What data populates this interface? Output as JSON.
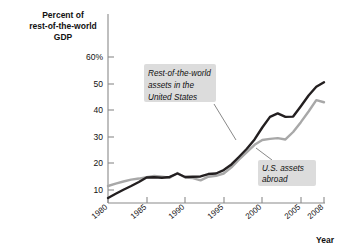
{
  "chart_data": {
    "type": "line",
    "title": "",
    "xlabel": "Year",
    "ylabel": "Percent of rest-of-the-world GDP",
    "ylabel_lines": [
      "Percent of",
      "rest-of-the-world",
      "GDP"
    ],
    "xlim": [
      1980,
      2008
    ],
    "ylim": [
      0,
      62
    ],
    "grid": false,
    "legend": "annotations-on-plot",
    "yticks": [
      10,
      20,
      30,
      40,
      50,
      60
    ],
    "ytick_labels": [
      "10",
      "20",
      "30",
      "40",
      "50",
      "60%"
    ],
    "xticks": [
      1980,
      1985,
      1990,
      1995,
      2000,
      2005,
      2008
    ],
    "xtick_labels": [
      "1980",
      "1985",
      "1990",
      "1995",
      "2000",
      "2005",
      "2008"
    ],
    "x": [
      1980,
      1981,
      1982,
      1983,
      1984,
      1985,
      1986,
      1987,
      1988,
      1989,
      1990,
      1991,
      1992,
      1993,
      1994,
      1995,
      1996,
      1997,
      1998,
      1999,
      2000,
      2001,
      2002,
      2003,
      2004,
      2005,
      2006,
      2007,
      2008
    ],
    "series": [
      {
        "name": "Rest-of-the-world assets in the United States",
        "color": "#231f20",
        "values": [
          7.0,
          8.6,
          10.1,
          11.5,
          13.0,
          14.7,
          14.8,
          14.6,
          14.9,
          16.2,
          14.9,
          15.0,
          15.1,
          16.0,
          16.2,
          17.5,
          19.6,
          22.5,
          25.5,
          29.0,
          33.5,
          37.5,
          38.8,
          37.5,
          37.6,
          41.5,
          45.5,
          48.8,
          50.5
        ]
      },
      {
        "name": "U.S. assets abroad",
        "color": "#a8a8a8",
        "values": [
          11.5,
          12.4,
          13.2,
          13.9,
          14.3,
          14.8,
          15.3,
          15.0,
          14.6,
          16.4,
          14.7,
          14.5,
          13.6,
          15.0,
          15.3,
          16.2,
          18.5,
          21.5,
          24.2,
          27.0,
          28.8,
          29.2,
          29.5,
          29.0,
          31.8,
          35.5,
          39.5,
          43.8,
          43.0
        ]
      }
    ],
    "annotations": [
      {
        "id": "annotation-row-assets",
        "lines": [
          "Rest-of-the-world",
          "assets in the",
          "United States"
        ],
        "target_series": "Rest-of-the-world assets in the United States"
      },
      {
        "id": "annotation-us-assets",
        "lines": [
          "U.S. assets",
          "abroad"
        ],
        "target_series": "U.S. assets abroad"
      }
    ]
  },
  "colors": {
    "dark_series": "#231f20",
    "gray_series": "#a8a8a8",
    "axis": "#8a8a8a",
    "annotation_box": "#dcdcdc",
    "text": "#111111",
    "background": "#ffffff"
  }
}
